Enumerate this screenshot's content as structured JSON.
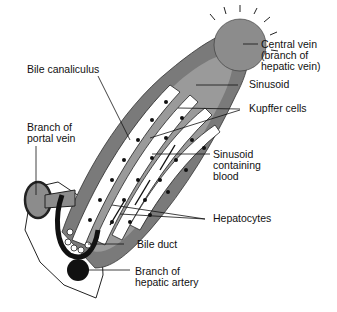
{
  "figure": {
    "colors": {
      "background": "#ffffff",
      "outer_band": "#7a7a7a",
      "sinusoid": "#9a9a9a",
      "central_vein": "#8c8c8c",
      "cells": "#ffffff",
      "nuclei": "#111111",
      "artery": "#111111",
      "outline": "#222222"
    }
  },
  "labels": {
    "bile_canaliculus": "Bile canaliculus",
    "central_vein_1": "Central vein",
    "central_vein_2": "(branch of",
    "central_vein_3": "hepatic vein)",
    "sinusoid": "Sinusoid",
    "branch_portal_1": "Branch of",
    "branch_portal_2": "portal vein",
    "kupffer": "Kupffer cells",
    "sinusoid_blood_1": "Sinusoid",
    "sinusoid_blood_2": "containing",
    "sinusoid_blood_3": "blood",
    "hepatocytes": "Hepatocytes",
    "bile_duct": "Bile duct",
    "hepatic_artery_1": "Branch of",
    "hepatic_artery_2": "hepatic artery"
  }
}
